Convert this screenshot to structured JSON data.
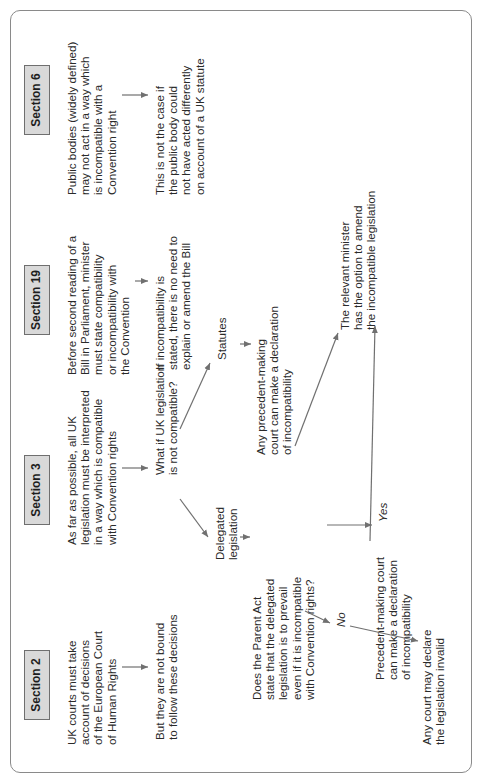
{
  "diagram": {
    "colors": {
      "frame": "#8a8a8a",
      "section_fill": "#d9d9d9",
      "section_border": "#6f6f6f",
      "arrow": "#707070",
      "text": "#2a2a2a"
    },
    "sections": [
      {
        "label": "Section 2",
        "text": "UK courts must take\naccount of decisions\nof the European Court\nof Human Rights",
        "followup": "But they are not bound\nto follow these decisions"
      },
      {
        "label": "Section 3",
        "text": "As far as possible, all UK\nlegislation must be interpreted\nin a way which is compatible\nwith Convention rights",
        "question": "What if UK legislation\nis not compatible?",
        "branches": {
          "delegated": "Delegated\nlegislation",
          "statutes": "Statutes",
          "parent_act_question": "Does the Parent Act\nstate that the delegated\nlegislation is to prevail\neven if it is incompatible\nwith Convention rights?",
          "statutes_outcome": "Any precedent-making\ncourt can make a declaration\nof incompatibility",
          "yes_label": "Yes",
          "no_label": "No",
          "yes_outcome": "Precedent-making court\ncan make a declaration\nof incompatibility",
          "no_outcome": "Any court may declare\nthe legislation invalid"
        }
      },
      {
        "label": "Section 19",
        "text": "Before second reading of a\nBill in Parliament, minister\nmust state compatibility\nor incompatibility with\nthe Convention",
        "followup": "If incompatibility is\nstated, there is no need to\nexplain or amend the Bill",
        "minister_outcome": "The relevant minister\nhas the option to amend\nthe incompatible legislation"
      },
      {
        "label": "Section 6",
        "text": "Public bodies (widely defined)\nmay not act in a way which\nis incompatible with a\nConvention right",
        "followup": "This is not the case if\nthe public body could\nnot have acted differently\non account of a UK statute"
      }
    ]
  }
}
